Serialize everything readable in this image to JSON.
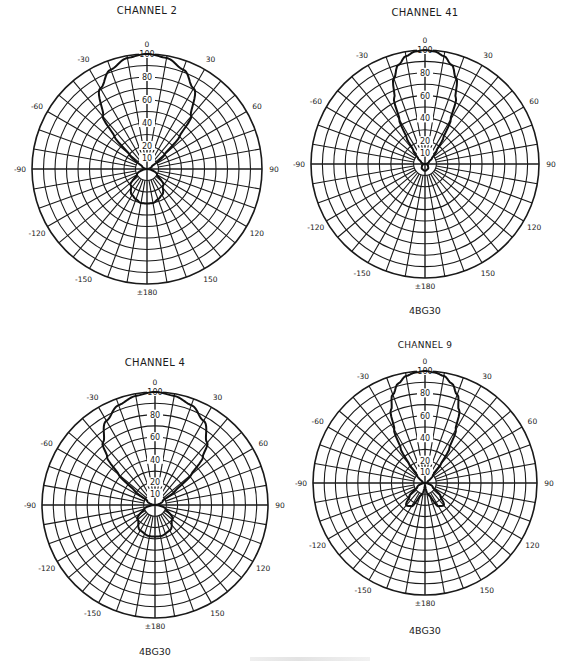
{
  "chart_data": [
    {
      "type": "polar",
      "title": "CHANNEL 2",
      "model": "",
      "center": [
        147,
        169
      ],
      "radius": 115,
      "title_pos": [
        147,
        14
      ],
      "model_pos": null,
      "angle_ticks": [
        0,
        30,
        60,
        90,
        120,
        150,
        180,
        -150,
        -120,
        -90,
        -60,
        -30
      ],
      "angle_labels": [
        "0",
        "30",
        "60",
        "90",
        "120",
        "150",
        "±180",
        "-150",
        "-120",
        "-90",
        "-60",
        "-30"
      ],
      "radial_labels": [
        "10",
        "20",
        "40",
        "60",
        "80",
        "100"
      ],
      "radial_ticks": [
        10,
        20,
        40,
        60,
        80,
        100
      ],
      "rlim": [
        0,
        100
      ],
      "grid": {
        "rings_every": 10,
        "spokes_every_deg": 10
      },
      "series": [
        {
          "name": "relative field",
          "angles_deg": [
            0,
            10,
            20,
            30,
            40,
            45,
            50,
            60,
            90,
            120,
            135,
            150,
            160,
            170,
            180,
            -170,
            -160,
            -150,
            -135,
            -120,
            -90,
            -60,
            -50,
            -45,
            -40,
            -30,
            -20,
            -10
          ],
          "values": [
            100,
            98,
            92,
            81,
            60,
            40,
            20,
            5,
            0,
            10,
            20,
            26,
            28,
            30,
            30,
            30,
            28,
            26,
            20,
            10,
            0,
            5,
            20,
            40,
            60,
            81,
            92,
            98
          ]
        }
      ]
    },
    {
      "type": "polar",
      "title": "CHANNEL 41",
      "model": "4BG30",
      "center": [
        425,
        164
      ],
      "radius": 114,
      "title_pos": [
        425,
        16
      ],
      "model_pos": [
        425,
        314
      ],
      "angle_ticks": [
        0,
        30,
        60,
        90,
        120,
        150,
        180,
        -150,
        -120,
        -90,
        -60,
        -30
      ],
      "angle_labels": [
        "0",
        "30",
        "60",
        "90",
        "120",
        "150",
        "±180",
        "-150",
        "-120",
        "-90",
        "-60",
        "-30"
      ],
      "radial_labels": [
        "10",
        "20",
        "40",
        "60",
        "80",
        "100"
      ],
      "radial_ticks": [
        10,
        20,
        40,
        60,
        80,
        100
      ],
      "rlim": [
        0,
        100
      ],
      "grid": {
        "rings_every": 10,
        "spokes_every_deg": 10
      },
      "series": [
        {
          "name": "relative field",
          "angles_deg": [
            0,
            5,
            10,
            15,
            20,
            25,
            30,
            35,
            40,
            50,
            60,
            90,
            120,
            150,
            180,
            -150,
            -120,
            -90,
            -60,
            -50,
            -40,
            -35,
            -30,
            -25,
            -20,
            -15,
            -10,
            -5
          ],
          "values": [
            100,
            99,
            96,
            90,
            80,
            64,
            45,
            28,
            16,
            8,
            4,
            0,
            3,
            5,
            6,
            5,
            3,
            0,
            4,
            8,
            16,
            28,
            45,
            64,
            80,
            90,
            96,
            99
          ]
        }
      ]
    },
    {
      "type": "polar",
      "title": "CHANNEL 4",
      "model": "4BG30",
      "center": [
        155,
        505
      ],
      "radius": 113,
      "title_pos": [
        155,
        366
      ],
      "model_pos": [
        155,
        655
      ],
      "angle_ticks": [
        0,
        30,
        60,
        90,
        120,
        150,
        180,
        -150,
        -120,
        -90,
        -60,
        -30
      ],
      "angle_labels": [
        "0",
        "30",
        "60",
        "90",
        "120",
        "150",
        "±180",
        "-150",
        "-120",
        "-90",
        "-60",
        "-30"
      ],
      "radial_labels": [
        "10",
        "20",
        "40",
        "60",
        "80",
        "100"
      ],
      "radial_ticks": [
        10,
        20,
        40,
        60,
        80,
        100
      ],
      "rlim": [
        0,
        100
      ],
      "grid": {
        "rings_every": 10,
        "spokes_every_deg": 10
      },
      "series": [
        {
          "name": "relative field",
          "angles_deg": [
            0,
            10,
            20,
            30,
            40,
            45,
            50,
            55,
            60,
            90,
            110,
            130,
            150,
            170,
            180,
            -170,
            -150,
            -130,
            -110,
            -90,
            -60,
            -55,
            -50,
            -45,
            -40,
            -30,
            -20,
            -10
          ],
          "values": [
            100,
            98,
            94,
            86,
            72,
            60,
            42,
            22,
            8,
            0,
            10,
            20,
            26,
            28,
            28,
            28,
            26,
            20,
            10,
            0,
            8,
            22,
            42,
            60,
            72,
            86,
            94,
            98
          ]
        }
      ]
    },
    {
      "type": "polar",
      "title": "CHANNEL 9",
      "model": "4BG30",
      "center": [
        425,
        483
      ],
      "radius": 112,
      "title_pos": [
        425,
        348
      ],
      "model_pos": [
        425,
        634
      ],
      "angle_ticks": [
        0,
        30,
        60,
        90,
        120,
        150,
        180,
        -150,
        -120,
        -90,
        -60,
        -30
      ],
      "angle_labels": [
        "0",
        "30",
        "60",
        "90",
        "120",
        "150",
        "±180",
        "-150",
        "-120",
        "-90",
        "-60",
        "-30"
      ],
      "radial_labels": [
        "10",
        "20",
        "40",
        "60",
        "80",
        "100"
      ],
      "radial_ticks": [
        10,
        20,
        40,
        60,
        80,
        100
      ],
      "rlim": [
        0,
        100
      ],
      "grid": {
        "rings_every": 10,
        "spokes_every_deg": 10
      },
      "series": [
        {
          "name": "relative field",
          "angles_deg": [
            0,
            5,
            10,
            15,
            20,
            25,
            30,
            35,
            40,
            45,
            60,
            90,
            120,
            130,
            140,
            150,
            160,
            180,
            -160,
            -150,
            -140,
            -130,
            -120,
            -90,
            -60,
            -45,
            -40,
            -35,
            -30,
            -25,
            -20,
            -15,
            -10,
            -5
          ],
          "values": [
            100,
            99,
            97,
            92,
            84,
            72,
            55,
            38,
            22,
            10,
            3,
            0,
            8,
            18,
            26,
            24,
            12,
            2,
            12,
            24,
            26,
            18,
            8,
            0,
            3,
            10,
            22,
            38,
            55,
            72,
            84,
            92,
            97,
            99
          ]
        }
      ]
    }
  ],
  "charts": [
    {
      "title": "CHANNEL 2",
      "model": ""
    },
    {
      "title": "CHANNEL 41",
      "model": "4BG30"
    },
    {
      "title": "CHANNEL 4",
      "model": "4BG30"
    },
    {
      "title": "CHANNEL 9",
      "model": "4BG30"
    }
  ]
}
